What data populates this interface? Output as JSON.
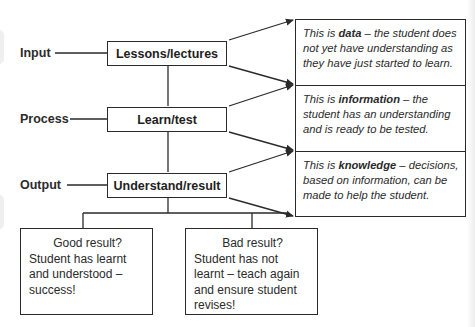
{
  "diagram": {
    "row_labels": {
      "input": "Input",
      "process": "Process",
      "output": "Output"
    },
    "stages": {
      "lessons": "Lessons/lectures",
      "learn": "Learn/test",
      "understand": "Understand/result"
    },
    "descriptions": {
      "data": {
        "prefix": "This is ",
        "term": "data",
        "suffix": " – the student does not yet have understanding as they have just started to learn."
      },
      "information": {
        "prefix": "This is ",
        "term": "information",
        "suffix": " – the student has an understanding and is ready to be tested."
      },
      "knowledge": {
        "prefix": "This is ",
        "term": "knowledge",
        "suffix": " – decisions, based on information, can be made to help the student."
      }
    },
    "results": {
      "good": {
        "heading": "Good result?",
        "body": "Student has learnt and understood – success!"
      },
      "bad": {
        "heading": "Bad result?",
        "body": "Student has not learnt – teach again and ensure student revises!"
      }
    },
    "colors": {
      "line": "#2a2a2a",
      "text": "#1e1e1e",
      "background": "#ffffff"
    }
  }
}
